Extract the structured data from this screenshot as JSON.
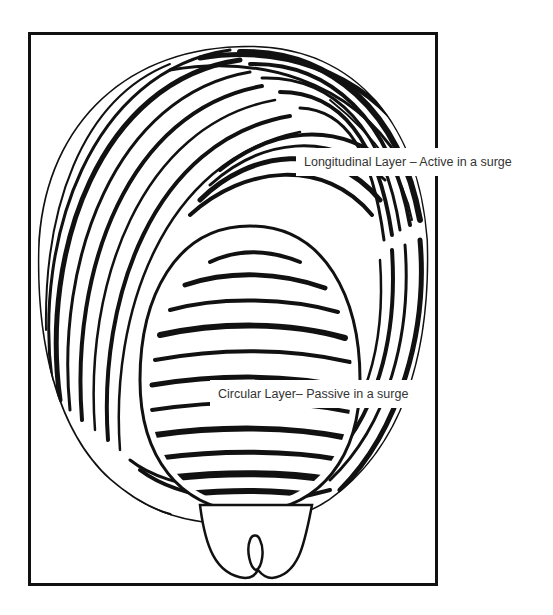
{
  "figure": {
    "labels": {
      "longitudinal": "Longitudinal Layer – Active in a surge",
      "circular": "Circular Layer– Passive in a surge"
    },
    "colors": {
      "ink": "#111111",
      "paper": "#ffffff",
      "label_text": "#333333"
    }
  }
}
